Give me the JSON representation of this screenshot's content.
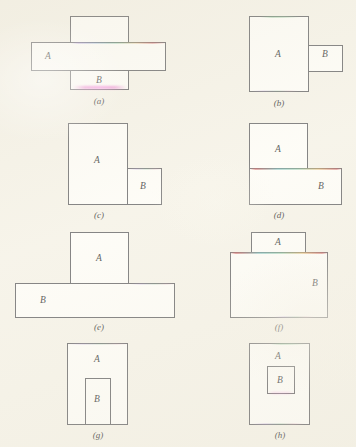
{
  "figure": {
    "background_color": "#f4f1e6",
    "stroke_color": "#5d5d5f",
    "fill_color": "#fdfcf7",
    "label_color": "#2c2c2e",
    "columns": 2,
    "rows": 4,
    "panel_count": 8
  },
  "panels": [
    {
      "id": "a",
      "caption": "(a)",
      "relation": "overlapping-cross",
      "shapes": [
        {
          "name": "A",
          "label": "A",
          "orientation": "horizontal",
          "x": 31,
          "y": 42,
          "w": 135,
          "h": 29
        },
        {
          "name": "B",
          "label": "B",
          "orientation": "vertical",
          "x": 70,
          "y": 16,
          "w": 59,
          "h": 74
        }
      ],
      "labels": {
        "a": "A",
        "b": "B"
      }
    },
    {
      "id": "b",
      "caption": "(b)",
      "relation": "adjacent-edge-touching",
      "shapes": [
        {
          "name": "A",
          "label": "A",
          "orientation": "vertical",
          "x": 249,
          "y": 16,
          "w": 60,
          "h": 76
        },
        {
          "name": "B",
          "label": "B",
          "orientation": "horizontal",
          "x": 308,
          "y": 45,
          "w": 35,
          "h": 27
        }
      ],
      "labels": {
        "a": "A",
        "b": "B"
      }
    },
    {
      "id": "c",
      "caption": "(c)",
      "relation": "adjacent-bottom-aligned",
      "shapes": [
        {
          "name": "A",
          "label": "A",
          "orientation": "vertical",
          "x": 68,
          "y": 123,
          "w": 60,
          "h": 82
        },
        {
          "name": "B",
          "label": "B",
          "orientation": "square",
          "x": 127,
          "y": 168,
          "w": 35,
          "h": 37
        }
      ],
      "labels": {
        "a": "A",
        "b": "B"
      }
    },
    {
      "id": "d",
      "caption": "(d)",
      "relation": "overlapping-corner",
      "shapes": [
        {
          "name": "A",
          "label": "A",
          "orientation": "vertical",
          "x": 249,
          "y": 123,
          "w": 59,
          "h": 82
        },
        {
          "name": "B",
          "label": "B",
          "orientation": "horizontal",
          "x": 249,
          "y": 168,
          "w": 93,
          "h": 37
        }
      ],
      "labels": {
        "a": "A",
        "b": "B"
      }
    },
    {
      "id": "e",
      "caption": "(e)",
      "relation": "overlapping-tee",
      "shapes": [
        {
          "name": "A",
          "label": "A",
          "orientation": "vertical",
          "x": 70,
          "y": 232,
          "w": 59,
          "h": 86
        },
        {
          "name": "B",
          "label": "B",
          "orientation": "horizontal",
          "x": 15,
          "y": 283,
          "w": 160,
          "h": 35
        }
      ],
      "labels": {
        "a": "A",
        "b": "B"
      }
    },
    {
      "id": "f",
      "caption": "(f)",
      "relation": "overlapping-nested-edges",
      "shapes": [
        {
          "name": "A",
          "label": "A",
          "orientation": "vertical",
          "x": 251,
          "y": 232,
          "w": 55,
          "h": 86
        },
        {
          "name": "B",
          "label": "B",
          "orientation": "horizontal",
          "x": 230,
          "y": 252,
          "w": 98,
          "h": 66
        }
      ],
      "labels": {
        "a": "A",
        "b": "B"
      }
    },
    {
      "id": "g",
      "caption": "(g)",
      "relation": "contained-touching-boundary",
      "shapes": [
        {
          "name": "A",
          "label": "A",
          "orientation": "vertical",
          "x": 67,
          "y": 343,
          "w": 61,
          "h": 82
        },
        {
          "name": "B",
          "label": "B",
          "orientation": "vertical",
          "x": 85,
          "y": 378,
          "w": 26,
          "h": 47
        }
      ],
      "labels": {
        "a": "A",
        "b": "B"
      }
    },
    {
      "id": "h",
      "caption": "(h)",
      "relation": "contained-interior",
      "shapes": [
        {
          "name": "A",
          "label": "A",
          "orientation": "vertical",
          "x": 249,
          "y": 343,
          "w": 61,
          "h": 82
        },
        {
          "name": "B",
          "label": "B",
          "orientation": "square",
          "x": 267,
          "y": 366,
          "w": 28,
          "h": 28
        }
      ],
      "labels": {
        "a": "A",
        "b": "B"
      }
    }
  ]
}
